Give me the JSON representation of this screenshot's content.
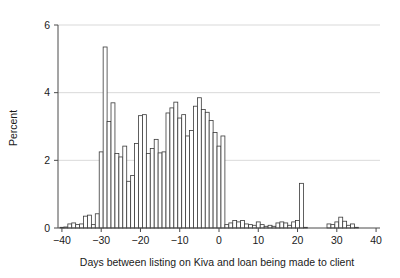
{
  "chart_data": {
    "type": "bar",
    "title": "",
    "subtitle": "",
    "xlabel": "Days between listing on Kiva and loan being made to client",
    "ylabel": "Percent",
    "xlim": [
      -41,
      41
    ],
    "ylim": [
      0,
      6
    ],
    "xticks": [
      -40,
      -30,
      -20,
      -10,
      0,
      10,
      20,
      30,
      40
    ],
    "xtick_labels": [
      "−40",
      "−30",
      "−20",
      "−10",
      "0",
      "10",
      "20",
      "30",
      "40"
    ],
    "yticks": [
      0,
      2,
      4,
      6
    ],
    "ytick_labels": [
      "0",
      "2",
      "4",
      "6"
    ],
    "grid": "horizontal",
    "legend": "none",
    "bin_width": 1,
    "categories": [
      -40,
      -39,
      -38,
      -37,
      -36,
      -35,
      -34,
      -33,
      -32,
      -31,
      -30,
      -29,
      -28,
      -27,
      -26,
      -25,
      -24,
      -23,
      -22,
      -21,
      -20,
      -19,
      -18,
      -17,
      -16,
      -15,
      -14,
      -13,
      -12,
      -11,
      -10,
      -9,
      -8,
      -7,
      -6,
      -5,
      -4,
      -3,
      -2,
      -1,
      0,
      1,
      2,
      3,
      4,
      5,
      6,
      7,
      8,
      9,
      10,
      11,
      12,
      13,
      14,
      15,
      16,
      17,
      18,
      19,
      20,
      21,
      22,
      23,
      24,
      25,
      26,
      27,
      28,
      29,
      30,
      31,
      32,
      33,
      34,
      35,
      36,
      37,
      38,
      39,
      40
    ],
    "values": [
      0.02,
      0.03,
      0.12,
      0.15,
      0.1,
      0.12,
      0.35,
      0.38,
      0.1,
      0.42,
      2.25,
      5.35,
      3.15,
      3.7,
      2.2,
      2.1,
      2.42,
      1.38,
      1.55,
      2.5,
      3.32,
      3.35,
      2.2,
      2.35,
      2.62,
      2.22,
      2.25,
      3.4,
      3.55,
      3.72,
      3.25,
      3.35,
      2.72,
      2.88,
      3.6,
      3.85,
      3.5,
      3.42,
      3.18,
      2.82,
      2.42,
      2.72,
      0.1,
      0.15,
      0.22,
      0.18,
      0.22,
      0.12,
      0.1,
      0.08,
      0.18,
      0.1,
      0.05,
      0.08,
      0.05,
      0.15,
      0.18,
      0.15,
      0.08,
      0.18,
      0.22,
      1.32,
      0.02,
      0.0,
      0.0,
      0.0,
      0.0,
      0.0,
      0.12,
      0.1,
      0.18,
      0.32,
      0.2,
      0.08,
      0.12,
      0.02,
      0.0,
      0.0,
      0.0,
      0.0,
      0.0
    ]
  },
  "colors": {
    "bar_fill": "#ffffff",
    "bar_stroke": "#3a3a3a",
    "axis": "#4a4a4a",
    "grid": "#cfcfcf",
    "text": "#1a1a1a",
    "background": "#ffffff"
  }
}
